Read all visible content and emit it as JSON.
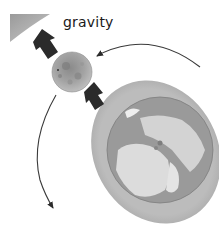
{
  "diagram": {
    "title": "",
    "labels": {
      "gravity": "gravity"
    },
    "elements": [
      {
        "name": "sun",
        "description": "partial Sun at top-left corner"
      },
      {
        "name": "moon",
        "description": "cratered gray Moon"
      },
      {
        "name": "earth",
        "description": "Earth with atmosphere halo"
      },
      {
        "name": "gravity-arrow-sun",
        "description": "black arrow from Moon toward Sun"
      },
      {
        "name": "gravity-arrow-earth",
        "description": "black arrow from Earth toward Moon"
      },
      {
        "name": "orbit-arrow-incoming",
        "description": "curved orbit arrow arriving at Moon from right"
      },
      {
        "name": "orbit-arrow-outgoing",
        "description": "curved orbit arrow leaving Moon downward"
      }
    ],
    "colors": {
      "background": "#ffffff",
      "arrow": "#2b2b2b",
      "orbit_line": "#3a3a3a",
      "sun": "#a9a9a9",
      "moon": "#9c9c9c",
      "earth_halo": "#b8b8b8",
      "earth_ocean": "#8d8d8d",
      "earth_land": "#dcdcdc"
    }
  }
}
